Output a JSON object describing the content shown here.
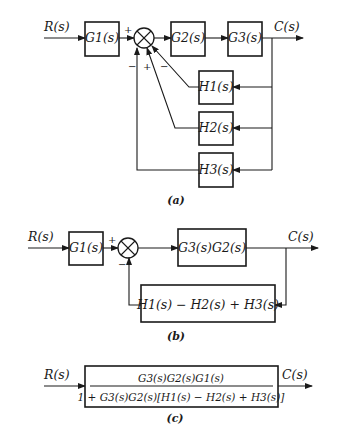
{
  "diagram_a": {
    "caption": "(a)",
    "input": "R(s)",
    "output": "C(s)",
    "blocks": {
      "g1": "G1(s)",
      "g2": "G2(s)",
      "g3": "G3(s)",
      "h1": "H1(s)",
      "h2": "H2(s)",
      "h3": "H3(s)"
    },
    "signs": {
      "input": "+",
      "h3": "−",
      "h2": "+",
      "h1": "−"
    }
  },
  "diagram_b": {
    "caption": "(b)",
    "input": "R(s)",
    "output": "C(s)",
    "blocks": {
      "g1": "G1(s)",
      "forward": "G3(s)G2(s)",
      "feedback": "H1(s) − H2(s) + H3(s)"
    },
    "signs": {
      "input": "+",
      "feedback": "−"
    }
  },
  "diagram_c": {
    "caption": "(c)",
    "input": "R(s)",
    "output": "C(s)",
    "numerator": "G3(s)G2(s)G1(s)",
    "denominator": "1 + G3(s)G2(s)[H1(s) − H2(s) + H3(s)]"
  },
  "colors": {
    "ink": "#1a1a1a",
    "background": "#ffffff"
  }
}
